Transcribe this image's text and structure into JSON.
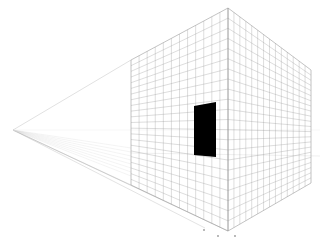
{
  "title": "Two-point perspective drawing of a gridded cube with door",
  "scene": {
    "background": "#ffffff",
    "grid_color": "#9a9a9a",
    "door_color": "#000000",
    "guide_color": "#c8c8c8",
    "vanishing_point": [
      13,
      130
    ],
    "front_edge": {
      "top": [
        228,
        8
      ],
      "bottom": [
        228,
        231
      ]
    },
    "left_face": {
      "top_left": [
        131,
        60
      ],
      "bottom_left": [
        131,
        185
      ],
      "top_right": [
        228,
        8
      ],
      "bottom_right": [
        228,
        231
      ]
    },
    "right_face": {
      "top_left": [
        228,
        8
      ],
      "bottom_left": [
        228,
        231
      ],
      "top_right": [
        311,
        70
      ],
      "bottom_right": [
        311,
        183
      ]
    },
    "door": {
      "points": [
        [
          194,
          106
        ],
        [
          216,
          102
        ],
        [
          216,
          157
        ],
        [
          194,
          155
        ]
      ]
    },
    "left_grid_columns": 12,
    "left_grid_rows": 22,
    "right_grid_columns": 14,
    "right_grid_rows": 22,
    "markers": [
      [
        204,
        230
      ],
      [
        218,
        236
      ],
      [
        235,
        236
      ]
    ],
    "labels": {
      "left_face": "left face grid",
      "right_face": "right face grid",
      "door": "door"
    }
  }
}
